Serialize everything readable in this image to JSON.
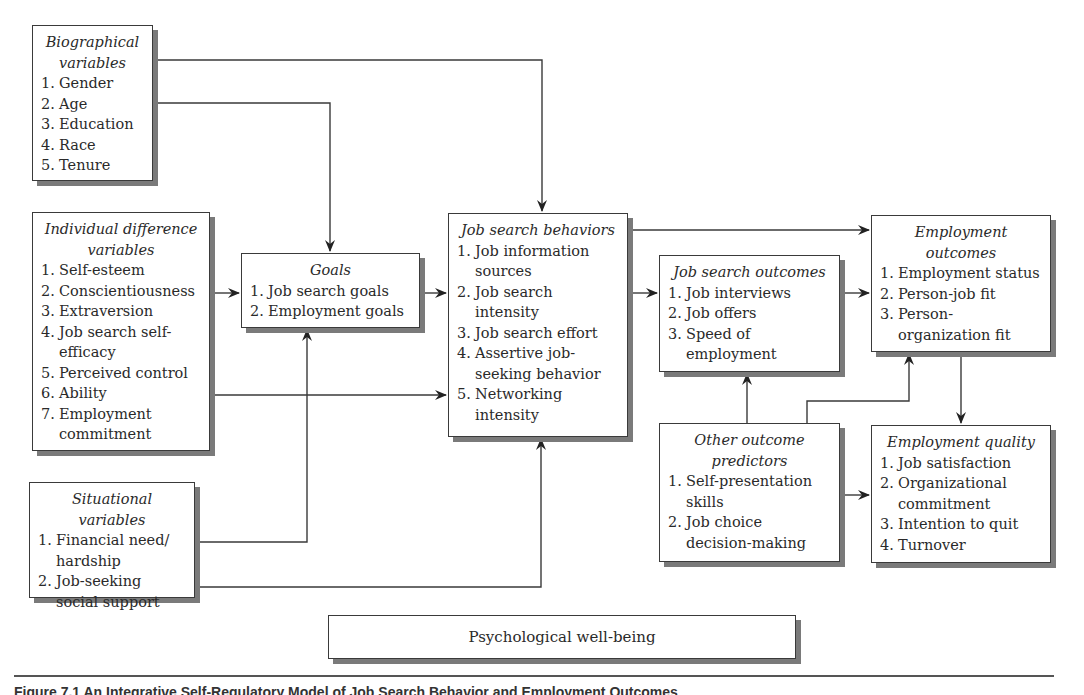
{
  "diagram": {
    "boxes": {
      "biographical": {
        "title": "Biographical variables",
        "items": [
          "Gender",
          "Age",
          "Education",
          "Race",
          "Tenure"
        ]
      },
      "individual": {
        "title": "Individual difference variables",
        "items": [
          "Self-esteem",
          "Conscientiousness",
          "Extraversion",
          "Job search self-efficacy",
          "Perceived control",
          "Ability",
          "Employment commitment"
        ]
      },
      "situational": {
        "title": "Situational variables",
        "items": [
          "Financial need/ hardship",
          "Job-seeking social support"
        ]
      },
      "goals": {
        "title": "Goals",
        "items": [
          "Job search goals",
          "Employment goals"
        ]
      },
      "behaviors": {
        "title": "Job search behaviors",
        "items": [
          "Job information sources",
          "Job search intensity",
          "Job search effort",
          "Assertive job-seeking behavior",
          "Networking intensity"
        ]
      },
      "search_outcomes": {
        "title": "Job search outcomes",
        "items": [
          "Job interviews",
          "Job offers",
          "Speed of employment"
        ]
      },
      "employment_outcomes": {
        "title": "Employment outcomes",
        "items": [
          "Employment status",
          "Person-job fit",
          "Person-organization fit"
        ]
      },
      "other_predictors": {
        "title": "Other outcome predictors",
        "items": [
          "Self-presentation skills",
          "Job choice decision-making"
        ]
      },
      "employment_quality": {
        "title": "Employment quality",
        "items": [
          "Job satisfaction",
          "Organizational commitment",
          "Intention to quit",
          "Turnover"
        ]
      },
      "wellbeing": {
        "title": "Psychological well-being"
      }
    },
    "nums": [
      "1.",
      "2.",
      "3.",
      "4.",
      "5.",
      "6.",
      "7."
    ],
    "caption": "Figure 7.1  An Integrative Self-Regulatory Model of Job Search Behavior and Employment Outcomes"
  }
}
